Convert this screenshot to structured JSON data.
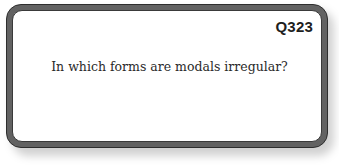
{
  "card": {
    "question_id": "Q323",
    "question_text": "In which forms are modals irregular?"
  },
  "colors": {
    "border": "#626262",
    "text": "#2a2a2a",
    "background": "#ffffff"
  }
}
